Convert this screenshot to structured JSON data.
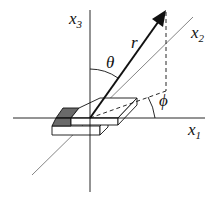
{
  "diagram": {
    "labels": {
      "x1": "x",
      "x1_sub": "1",
      "x2": "x",
      "x2_sub": "2",
      "x3": "x",
      "x3_sub": "3",
      "r": "r",
      "theta": "θ",
      "phi": "ϕ"
    },
    "colors": {
      "line": "#111111",
      "thin_line": "#555555",
      "shaded_face": "#6a6a6a",
      "background": "#ffffff"
    }
  }
}
